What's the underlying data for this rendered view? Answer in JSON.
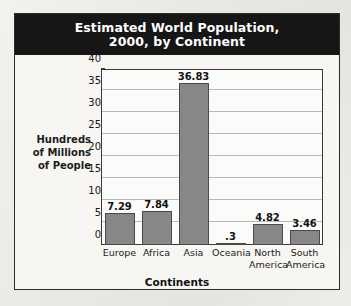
{
  "chart_data": {
    "type": "bar",
    "title": "Estimated World Population,\n2000, by Continent",
    "title_line1": "Estimated World Population,",
    "title_line2": "2000, by Continent",
    "xlabel": "Continents",
    "ylabel": "Hundreds\nof Millions\nof People",
    "ylabel_line1": "Hundreds",
    "ylabel_line2": "of Millions",
    "ylabel_line3": "of People",
    "categories": [
      "Europe",
      "Africa",
      "Asia",
      "Oceania",
      "North\nAmerica",
      "South\nAmerica"
    ],
    "values": [
      7.29,
      7.84,
      36.83,
      0.3,
      4.82,
      3.46
    ],
    "value_labels": [
      "7.29",
      "7.84",
      "36.83",
      ".3",
      "4.82",
      "3.46"
    ],
    "ylim": [
      0,
      40
    ],
    "yticks": [
      0,
      5,
      10,
      15,
      20,
      25,
      30,
      35,
      40
    ],
    "ytick_labels": [
      "0",
      "5",
      "10",
      "15",
      "20",
      "25",
      "30",
      "35",
      "40"
    ],
    "grid": true,
    "legend": false,
    "bar_color": "#878787",
    "bar_border_color": "#4a4a4a",
    "title_bg_color": "#161616",
    "title_text_color": "#ffffff",
    "plot_bg_color": "#fbfbfa",
    "grid_color": "#b9b9b9",
    "panel_border_color": "#2b2b2b"
  }
}
